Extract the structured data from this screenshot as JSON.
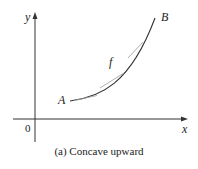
{
  "figure": {
    "caption": "(a) Concave upward",
    "labels": {
      "y_axis": "y",
      "x_axis": "x",
      "origin": "0",
      "point_a": "A",
      "point_b": "B",
      "function": "f"
    },
    "colors": {
      "axis": "#333333",
      "curve": "#333333",
      "tangent": "#888888"
    }
  }
}
